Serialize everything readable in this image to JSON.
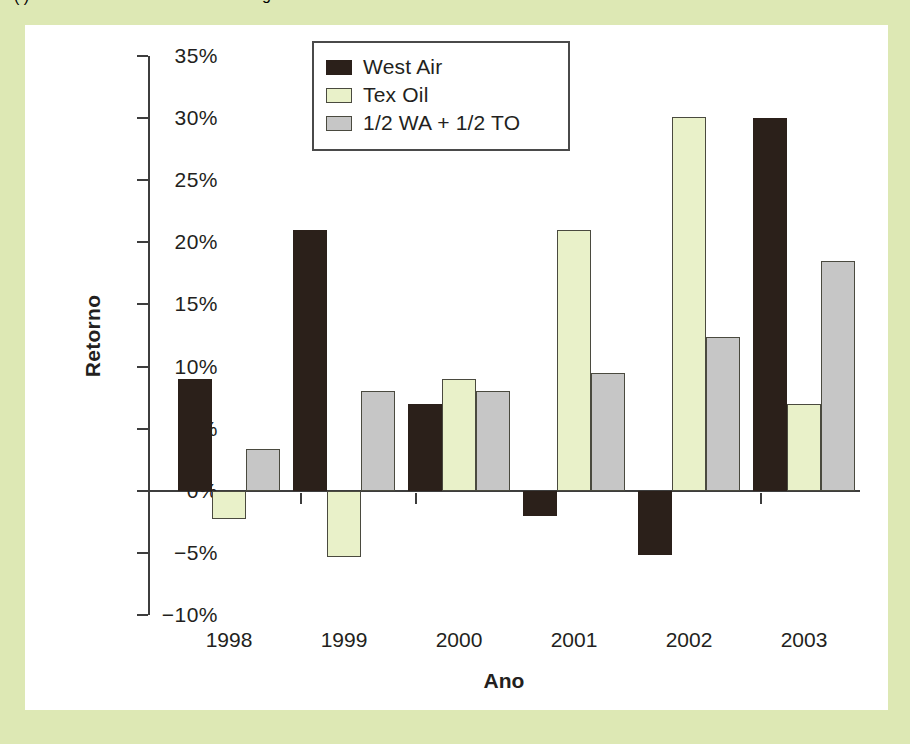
{
  "page": {
    "background_color": "#dde8b4",
    "panel_color": "#ffffff",
    "top_fragment_left": "( )",
    "top_fragment_right": "g"
  },
  "legend": {
    "position": "top-center-inside",
    "items": [
      {
        "label": "West Air",
        "color": "#2b201a",
        "key": "west-air"
      },
      {
        "label": "Tex Oil",
        "color": "#e9f1c9",
        "key": "tex-oil"
      },
      {
        "label": "1/2 WA + 1/2 TO",
        "color": "#c6c6c6",
        "key": "blend"
      }
    ]
  },
  "axes": {
    "y_title": "Retorno",
    "x_title": "Ano",
    "y_ticks": [
      "35%",
      "30%",
      "25%",
      "20%",
      "15%",
      "10%",
      "5%",
      "0%",
      "−5%",
      "−10%"
    ],
    "y_tick_values": [
      35,
      30,
      25,
      20,
      15,
      10,
      5,
      0,
      -5,
      -10
    ]
  },
  "chart_data": {
    "type": "bar",
    "title": "",
    "xlabel": "Ano",
    "ylabel": "Retorno",
    "ylim": [
      -10,
      35
    ],
    "yunit": "%",
    "grid": false,
    "legend_position": "top-center",
    "categories": [
      "1998",
      "1999",
      "2000",
      "2001",
      "2002",
      "2003"
    ],
    "series": [
      {
        "name": "West Air",
        "color": "#2b201a",
        "values": [
          9.0,
          21.0,
          7.0,
          -2.0,
          -5.2,
          30.0
        ]
      },
      {
        "name": "Tex Oil",
        "color": "#e9f1c9",
        "values": [
          -2.3,
          -5.3,
          9.0,
          21.0,
          30.1,
          7.0
        ]
      },
      {
        "name": "1/2 WA + 1/2 TO",
        "color": "#c6c6c6",
        "values": [
          3.4,
          8.0,
          8.0,
          9.5,
          12.4,
          18.5
        ]
      }
    ]
  }
}
